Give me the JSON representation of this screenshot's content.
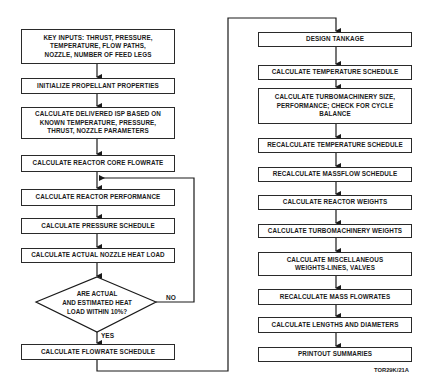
{
  "diagram": {
    "type": "flowchart",
    "left_column": [
      {
        "id": "key-inputs",
        "text": "KEY INPUTS:  THRUST, PRESSURE,\nTEMPERATURE, FLOW PATHS,\nNOZZLE, NUMBER OF FEED LEGS"
      },
      {
        "id": "init-propellant",
        "text": "INITIALIZE PROPELLANT PROPERTIES"
      },
      {
        "id": "calc-isp",
        "text": "CALCULATE DELIVERED ISP BASED ON\nKNOWN TEMPERATURE, PRESSURE,\nTHRUST, NOZZLE PARAMETERS"
      },
      {
        "id": "calc-core-flowrate",
        "text": "CALCULATE REACTOR CORE FLOWRATE"
      },
      {
        "id": "calc-reactor-performance",
        "text": "CALCULATE REACTOR PERFORMANCE"
      },
      {
        "id": "calc-pressure-schedule",
        "text": "CALCULATE PRESSURE SCHEDULE"
      },
      {
        "id": "calc-nozzle-heat-load",
        "text": "CALCULATE ACTUAL NOZZLE HEAT LOAD"
      },
      {
        "id": "calc-flowrate-schedule",
        "text": "CALCULATE FLOWRATE SCHEDULE"
      }
    ],
    "decision": {
      "text": "ARE ACTUAL\nAND ESTIMATED HEAT\nLOAD WITHIN 10%?",
      "yes_label": "YES",
      "no_label": "NO"
    },
    "right_column": [
      {
        "id": "design-tankage",
        "text": "DESIGN TANKAGE"
      },
      {
        "id": "calc-temperature-schedule",
        "text": "CALCULATE TEMPERATURE SCHEDULE"
      },
      {
        "id": "calc-turbomachinery-size",
        "text": "CALCULATE TURBOMACHINERY SIZE,\nPERFORMANCE; CHECK FOR CYCLE\nBALANCE"
      },
      {
        "id": "recalc-temperature-schedule",
        "text": "RECALCULATE TEMPERATURE SCHEDULE"
      },
      {
        "id": "recalc-massflow-schedule",
        "text": "RECALCULATE MASSFLOW SCHEDULE"
      },
      {
        "id": "calc-reactor-weights",
        "text": "CALCULATE REACTOR WEIGHTS"
      },
      {
        "id": "calc-turbomachinery-weights",
        "text": "CALCULATE TURBOMACHINERY WEIGHTS"
      },
      {
        "id": "calc-misc-weights",
        "text": "CALCULATE MISCELLANEOUS\nWEIGHTS-LINES, VALVES"
      },
      {
        "id": "recalc-mass-flowrates",
        "text": "RECALCULATE MASS FLOWRATES"
      },
      {
        "id": "calc-lengths-diameters",
        "text": "CALCULATE LENGTHS AND DIAMETERS"
      },
      {
        "id": "printout-summaries",
        "text": "PRINTOUT SUMMARIES"
      }
    ],
    "reference_code": "TOR29K/21A"
  }
}
